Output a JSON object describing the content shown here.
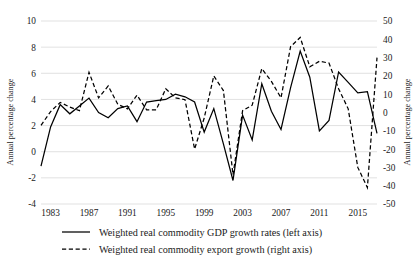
{
  "chart_data": {
    "type": "line",
    "title": "",
    "xlabel": "",
    "ylabel": "Annual percentage change",
    "y2label": "Annual percentage change",
    "grid": true,
    "legend_position": "bottom",
    "ylim": [
      -4,
      10
    ],
    "y2lim": [
      -50,
      50
    ],
    "yticks": [
      "10",
      "8",
      "6",
      "4",
      "2",
      "0",
      "-2",
      "-4"
    ],
    "ytick_values": [
      10,
      8,
      6,
      4,
      2,
      0,
      -2,
      -4
    ],
    "y2ticks": [
      "50",
      "40",
      "30",
      "20",
      "10",
      "0",
      "-10",
      "-20",
      "-30",
      "-40",
      "-50"
    ],
    "y2tick_values": [
      50,
      40,
      30,
      20,
      10,
      0,
      -10,
      -20,
      -30,
      -40,
      -50
    ],
    "xticks": [
      "1983",
      "1987",
      "1991",
      "1995",
      "1999",
      "2003",
      "2007",
      "2011",
      "2015"
    ],
    "xtick_values": [
      1983,
      1987,
      1991,
      1995,
      1999,
      2003,
      2007,
      2011,
      2015
    ],
    "xlim": [
      1982,
      2017
    ],
    "x": [
      1982,
      1983,
      1984,
      1985,
      1986,
      1987,
      1988,
      1989,
      1990,
      1991,
      1992,
      1993,
      1994,
      1995,
      1996,
      1997,
      1998,
      1999,
      2000,
      2001,
      2002,
      2003,
      2004,
      2005,
      2006,
      2007,
      2008,
      2009,
      2010,
      2011,
      2012,
      2013,
      2014,
      2015,
      2016,
      2017
    ],
    "series": [
      {
        "name": "Weighted real commodity GDP growth rates (left axis)",
        "axis": "left",
        "style": "solid",
        "values": [
          -1.1,
          1.9,
          3.6,
          2.9,
          3.5,
          4.1,
          3.0,
          2.6,
          3.3,
          3.5,
          2.3,
          3.8,
          3.9,
          4.0,
          4.4,
          4.2,
          3.8,
          1.5,
          3.3,
          0.6,
          -2.2,
          2.8,
          0.9,
          5.2,
          3.1,
          1.7,
          4.9,
          7.7,
          5.7,
          1.6,
          2.4,
          6.1,
          5.3,
          4.5,
          4.6,
          1.4
        ]
      },
      {
        "name": "Weighted real commodity export growth (right axis)",
        "axis": "right",
        "style": "dashed",
        "values": [
          -7.0,
          0.5,
          5.5,
          3.0,
          1.0,
          22.0,
          8.0,
          14.5,
          4.5,
          2.0,
          9.5,
          1.5,
          1.5,
          13.0,
          8.0,
          7.0,
          -20.0,
          -3.0,
          20.0,
          12.0,
          -34.0,
          1.0,
          4.0,
          24.0,
          17.0,
          8.0,
          36.0,
          41.0,
          25.0,
          28.0,
          27.0,
          13.0,
          2.0,
          -30.0,
          -41.0,
          30.0
        ]
      }
    ],
    "legend": [
      {
        "label": "Weighted real commodity GDP growth rates (left axis)",
        "style": "solid"
      },
      {
        "label": "Weighted real commodity export growth (right axis)",
        "style": "dashed"
      }
    ]
  }
}
